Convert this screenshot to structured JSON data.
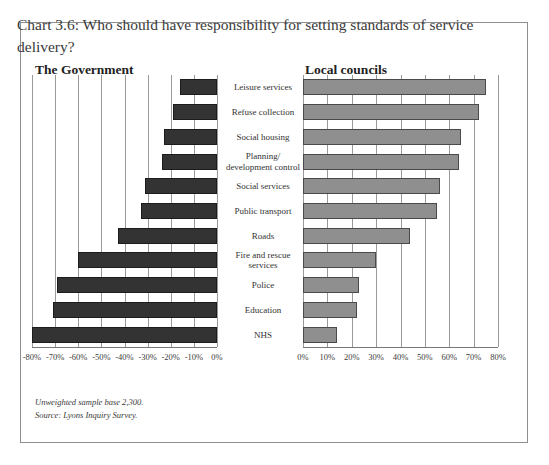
{
  "title": "Chart 3.6: Who should have responsibility for setting standards of service delivery?",
  "panels": {
    "left_heading": "The Government",
    "right_heading": "Local councils"
  },
  "footnote": {
    "line1": "Unweighted sample base 2,300.",
    "line2": "Source: Lyons Inquiry Survey."
  },
  "colors": {
    "government_bar": "#333333",
    "council_bar": "#8f8f8f",
    "gridline": "#9a9a9a",
    "frame": "#8e8e8e"
  },
  "chart_data": {
    "type": "bar",
    "title": "Chart 3.6: Who should have responsibility for setting standards of service delivery?",
    "orientation": "horizontal",
    "layout": "back-to-back (diverging) pair of panels sharing category labels in the centre",
    "grid": true,
    "legend_position": "panel headings above each chart",
    "categories": [
      "Leisure services",
      "Refuse collection",
      "Social housing",
      "Planning/ development control",
      "Social services",
      "Public transport",
      "Roads",
      "Fire and rescue services",
      "Police",
      "Education",
      "NHS"
    ],
    "series": [
      {
        "name": "The Government",
        "panel": "left",
        "xlabel": "",
        "ylabel": "",
        "xlim": [
          -80,
          0
        ],
        "xticks": [
          -80,
          -70,
          -60,
          -50,
          -40,
          -30,
          -20,
          -10,
          0
        ],
        "xtick_labels": [
          "-80%",
          "-70%",
          "-60%",
          "-50%",
          "-40%",
          "-30%",
          "-20%",
          "-10%",
          "0%"
        ],
        "values": [
          -16,
          -19,
          -23,
          -24,
          -31,
          -33,
          -43,
          -60,
          -69,
          -71,
          -80
        ]
      },
      {
        "name": "Local councils",
        "panel": "right",
        "xlabel": "",
        "ylabel": "",
        "xlim": [
          0,
          80
        ],
        "xticks": [
          0,
          10,
          20,
          30,
          40,
          50,
          60,
          70,
          80
        ],
        "xtick_labels": [
          "0%",
          "10%",
          "20%",
          "30%",
          "40%",
          "50%",
          "60%",
          "70%",
          "80%"
        ],
        "values": [
          75,
          72,
          65,
          64,
          56,
          55,
          44,
          30,
          23,
          22,
          14
        ]
      }
    ]
  }
}
